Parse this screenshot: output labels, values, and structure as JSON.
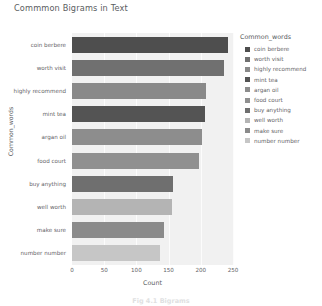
{
  "chart_data": {
    "type": "bar",
    "orientation": "horizontal",
    "title": "Commmon Bigrams in Text",
    "xlabel": "Count",
    "ylabel": "Common_words",
    "legend_title": "Common_words",
    "legend_position": "right",
    "grid": true,
    "xlim": [
      0,
      250
    ],
    "xticks": [
      0,
      50,
      100,
      150,
      200,
      250
    ],
    "xtick_labels": [
      "0",
      "50",
      "100",
      "150",
      "200",
      "250"
    ],
    "categories": [
      "coin berbere",
      "worth visit",
      "highly recommend",
      "mint tea",
      "argan oil",
      "food court",
      "buy anything",
      "well worth",
      "make sure",
      "number number"
    ],
    "values": [
      242,
      236,
      208,
      207,
      202,
      197,
      157,
      155,
      143,
      137
    ],
    "colors": [
      "#4e4e4e",
      "#707070",
      "#898989",
      "#545454",
      "#8d8d8d",
      "#909090",
      "#6f6f6f",
      "#b4b4b4",
      "#8b8b8b",
      "#c6c6c6"
    ],
    "plot_background": "#f1f1f1",
    "gridline_color": "#fcfcfc"
  },
  "legend": {
    "title": "Common_words",
    "items": [
      {
        "label": "coin berbere",
        "color": "#4e4e4e"
      },
      {
        "label": "worth visit",
        "color": "#707070"
      },
      {
        "label": "highly recommend",
        "color": "#898989"
      },
      {
        "label": "mint tea",
        "color": "#545454"
      },
      {
        "label": "argan oil",
        "color": "#8d8d8d"
      },
      {
        "label": "food court",
        "color": "#909090"
      },
      {
        "label": "buy anything",
        "color": "#6f6f6f"
      },
      {
        "label": "well worth",
        "color": "#b4b4b4"
      },
      {
        "label": "make sure",
        "color": "#8b8b8b"
      },
      {
        "label": "number number",
        "color": "#c6c6c6"
      }
    ]
  },
  "caption": {
    "text": "Fig 4.1 Bigrams"
  }
}
